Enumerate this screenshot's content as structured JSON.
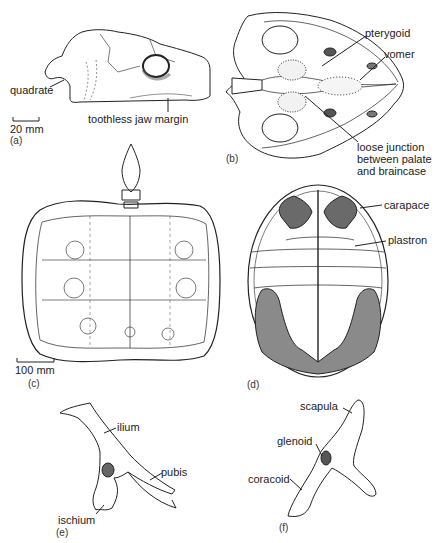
{
  "figure": {
    "panels": [
      {
        "id": "a",
        "label": "(a)",
        "description": "skull, lateral view",
        "annotations": [
          "quadrate",
          "toothless jaw margin"
        ],
        "scale_bar": "20 mm"
      },
      {
        "id": "b",
        "label": "(b)",
        "description": "skull, ventral (palatal) view",
        "annotations": [
          "pterygoid",
          "vomer",
          "loose junction between palate and braincase"
        ]
      },
      {
        "id": "c",
        "label": "(c)",
        "description": "skeleton in dorsal view (carapace)",
        "annotations": [],
        "scale_bar": "100 mm"
      },
      {
        "id": "d",
        "label": "(d)",
        "description": "shell, ventral view",
        "annotations": [
          "carapace",
          "plastron"
        ]
      },
      {
        "id": "e",
        "label": "(e)",
        "description": "pelvic girdle",
        "annotations": [
          "ilium",
          "pubis",
          "ischium"
        ]
      },
      {
        "id": "f",
        "label": "(f)",
        "description": "pectoral girdle",
        "annotations": [
          "scapula",
          "glenoid",
          "coracoid"
        ]
      }
    ]
  },
  "labels": {
    "a": {
      "panel": "(a)",
      "quadrate": "quadrate",
      "jaw": "toothless jaw margin",
      "scale": "20 mm"
    },
    "b": {
      "panel": "(b)",
      "pterygoid": "pterygoid",
      "vomer": "vomer",
      "junction_1": "loose junction",
      "junction_2": "between palate",
      "junction_3": "and braincase"
    },
    "c": {
      "panel": "(c)",
      "scale": "100 mm"
    },
    "d": {
      "panel": "(d)",
      "carapace": "carapace",
      "plastron": "plastron"
    },
    "e": {
      "panel": "(e)",
      "ilium": "ilium",
      "pubis": "pubis",
      "ischium": "ischium"
    },
    "f": {
      "panel": "(f)",
      "scapula": "scapula",
      "glenoid": "glenoid",
      "coracoid": "coracoid"
    }
  }
}
